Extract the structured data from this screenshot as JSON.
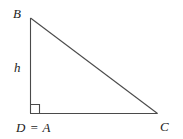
{
  "figure": {
    "name": "right-triangle-diagram",
    "description_labels": {
      "vertex_top": "B",
      "vertex_bottom_left": "D = A",
      "vertex_bottom_right": "C",
      "side_vertical": "h"
    },
    "colors": {
      "background": "#ffffff",
      "stroke": "#4a4a4a",
      "text": "#1c1c1c"
    },
    "geometry": {
      "vertex_B": [
        30,
        18
      ],
      "vertex_D_A": [
        30,
        113
      ],
      "vertex_C": [
        157,
        113
      ],
      "right_angle_marker": {
        "at": "D = A",
        "size": 9
      },
      "stroke_width": 1
    }
  }
}
